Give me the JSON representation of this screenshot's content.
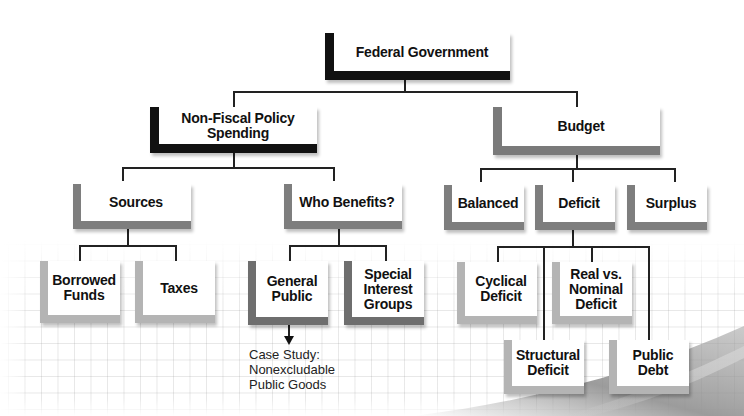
{
  "diagram": {
    "type": "hierarchy",
    "root": {
      "label": "Federal Government",
      "children": [
        {
          "label": "Non-Fiscal Policy\nSpending",
          "children": [
            {
              "label": "Sources",
              "children": [
                {
                  "label": "Borrowed\nFunds"
                },
                {
                  "label": "Taxes"
                }
              ]
            },
            {
              "label": "Who Benefits?",
              "children": [
                {
                  "label": "General\nPublic",
                  "annotation": "Case Study:\nNonexcludable\nPublic Goods"
                },
                {
                  "label": "Special\nInterest\nGroups"
                }
              ]
            }
          ]
        },
        {
          "label": "Budget",
          "children": [
            {
              "label": "Balanced"
            },
            {
              "label": "Deficit",
              "children": [
                {
                  "label": "Cyclical\nDeficit"
                },
                {
                  "label": "Structural\nDeficit"
                },
                {
                  "label": "Real vs.\nNominal\nDeficit"
                },
                {
                  "label": "Public\nDebt"
                }
              ]
            },
            {
              "label": "Surplus"
            }
          ]
        }
      ]
    }
  },
  "nodes": {
    "federal_government": "Federal Government",
    "non_fiscal_policy_spending": "Non-Fiscal Policy\nSpending",
    "budget": "Budget",
    "sources": "Sources",
    "who_benefits": "Who Benefits?",
    "balanced": "Balanced",
    "deficit": "Deficit",
    "surplus": "Surplus",
    "borrowed_funds": "Borrowed\nFunds",
    "taxes": "Taxes",
    "general_public": "General\nPublic",
    "special_interest_groups": "Special\nInterest\nGroups",
    "cyclical_deficit": "Cyclical\nDeficit",
    "real_vs_nominal_deficit": "Real vs.\nNominal\nDeficit",
    "structural_deficit": "Structural\nDeficit",
    "public_debt": "Public\nDebt"
  },
  "annotation": {
    "case_study": "Case Study:\nNonexcludable\nPublic Goods"
  },
  "colors": {
    "level1_bracket": "#111111",
    "level2_left_bracket": "#111111",
    "level2_right_bracket": "#7a7a7a",
    "level3_bracket": "#7e7e7e",
    "level4_dark_bracket": "#6e6e6e",
    "level4_light_bracket": "#b4b4b4",
    "connector": "#222222"
  }
}
